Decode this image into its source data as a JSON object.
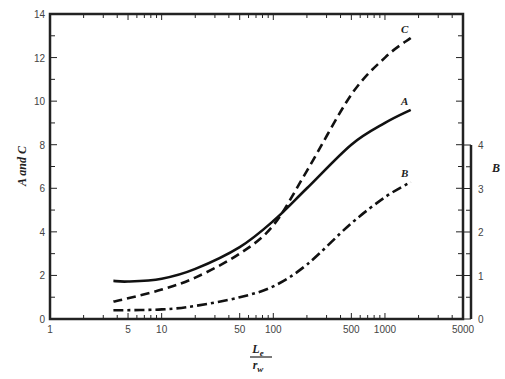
{
  "chart_data": {
    "type": "line",
    "title": "",
    "xlabel": "L_e / r_w",
    "xlabel_num": "L",
    "xlabel_num_sub": "e",
    "xlabel_den": "r",
    "xlabel_den_sub": "w",
    "ylabel": "A and C",
    "y2label": "B",
    "xscale": "log",
    "xlim": [
      1,
      5000
    ],
    "ylim": [
      0,
      14
    ],
    "y2lim": [
      0,
      4
    ],
    "xticks": [
      1,
      5,
      10,
      50,
      100,
      500,
      1000,
      5000
    ],
    "xtick_labels": [
      "1",
      "5",
      "10",
      "50",
      "100",
      "500",
      "1000",
      "5000"
    ],
    "yticks": [
      0,
      2,
      4,
      6,
      8,
      10,
      12,
      14
    ],
    "ytick_labels": [
      "0",
      "2",
      "4",
      "6",
      "8",
      "10",
      "12",
      "14"
    ],
    "y2ticks": [
      0,
      1,
      2,
      3,
      4
    ],
    "y2tick_labels": [
      "0",
      "1",
      "2",
      "3",
      "4"
    ],
    "grid": false,
    "series": [
      {
        "name": "A",
        "axis": "left",
        "style": "solid",
        "x": [
          3.7,
          5,
          10,
          20,
          50,
          100,
          200,
          500,
          1000,
          1700
        ],
        "values": [
          1.75,
          1.72,
          1.85,
          2.3,
          3.3,
          4.5,
          6.0,
          8.0,
          9.0,
          9.6
        ]
      },
      {
        "name": "C",
        "axis": "left",
        "style": "dashed",
        "x": [
          3.7,
          5,
          10,
          20,
          50,
          100,
          200,
          500,
          1000,
          1700
        ],
        "values": [
          0.8,
          0.95,
          1.35,
          1.9,
          3.0,
          4.3,
          6.8,
          10.3,
          12.0,
          12.9
        ]
      },
      {
        "name": "B",
        "axis": "right",
        "style": "dash-dot",
        "x": [
          3.7,
          10,
          20,
          50,
          100,
          200,
          500,
          1000,
          1700
        ],
        "values": [
          0.2,
          0.22,
          0.3,
          0.5,
          0.75,
          1.25,
          2.2,
          2.8,
          3.15
        ]
      }
    ]
  },
  "colors": {
    "line": "#111111",
    "axis": "#222222",
    "text": "#444444"
  }
}
